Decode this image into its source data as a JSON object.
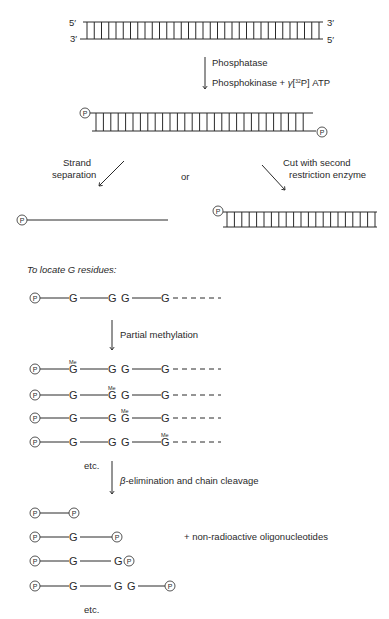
{
  "strand_ends": {
    "top_left": "5′",
    "bottom_left": "3′",
    "top_right": "3′",
    "bottom_right": "5′"
  },
  "step1": {
    "line1": "Phosphatase",
    "line2_prefix": "Phosphokinase + ",
    "gamma": "γ",
    "line2_bracket_open": "[",
    "isotope": "32",
    "line2_suffix": "P] ATP"
  },
  "phosphate_label": "P",
  "branch": {
    "left_line1": "Strand",
    "left_line2": "separation",
    "or": "or",
    "right_line1": "Cut with second",
    "right_line2": "restriction enzyme"
  },
  "section_title": "To locate G residues:",
  "residue": "G",
  "methyl": "Me",
  "step2": "Partial methylation",
  "step3": {
    "beta": "β",
    "text": "-elimination and chain cleavage"
  },
  "etc": "etc.",
  "byproduct": "+ non-radioactive oligonucleotides",
  "methylated_rows": [
    {
      "methylated_position": 1
    },
    {
      "methylated_position": 2
    },
    {
      "methylated_position": 3
    },
    {
      "methylated_position": 4
    }
  ],
  "cleavage_products": [
    {
      "residues": ""
    },
    {
      "residues": "G"
    },
    {
      "residues": "G G"
    },
    {
      "residues": "G GG"
    }
  ]
}
